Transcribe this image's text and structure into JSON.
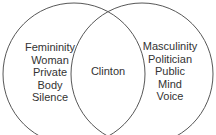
{
  "diagram": {
    "type": "venn",
    "left_set": {
      "items": [
        "Femininity",
        "Woman",
        "Private",
        "Body",
        "Silence"
      ]
    },
    "intersection": {
      "items": [
        "Clinton"
      ]
    },
    "right_set": {
      "items": [
        "Masculinity",
        "Politician",
        "Public",
        "Mind",
        "Voice"
      ]
    },
    "stroke_color": "#444444"
  }
}
